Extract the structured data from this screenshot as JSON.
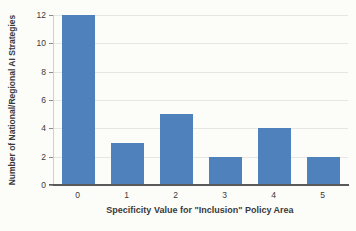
{
  "chart_data": {
    "type": "bar",
    "title": "",
    "categories": [
      "0",
      "1",
      "2",
      "3",
      "4",
      "5"
    ],
    "values": [
      12,
      3,
      5,
      2,
      4,
      2
    ],
    "xlabel": "Specificity Value for \"Inclusion\" Policy Area",
    "ylabel": "Number of National/Regional AI Strategies",
    "ylim": [
      0,
      12
    ],
    "yticks": [
      0,
      2,
      4,
      6,
      8,
      10,
      12
    ],
    "grid": true,
    "legend": "none"
  },
  "colors": {
    "bar_fill": "#4f81bd",
    "gridline": "#e6e6e2",
    "x_axis_line": "#595959",
    "y_axis_line": "#c7d1e0",
    "tick_mark": "#8a8a8a",
    "text": "#3a3a3a",
    "background": "#fcfcf9"
  }
}
